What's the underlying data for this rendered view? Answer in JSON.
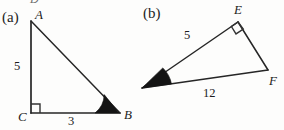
{
  "figure": {
    "background_color": "#fdfdfc",
    "ink_color": "#1c1c1c",
    "clipped_glyph_top": "D",
    "panels": [
      {
        "tag": "(a)",
        "tag_pos": {
          "x": 2,
          "y": 10
        },
        "triangle": {
          "name": "triangle-abc",
          "vertices": [
            {
              "label": "A",
              "x": 31,
              "y": 21,
              "label_x": 35,
              "label_y": 8
            },
            {
              "label": "B",
              "x": 119,
              "y": 113,
              "label_x": 124,
              "label_y": 108
            },
            {
              "label": "C",
              "x": 31,
              "y": 113,
              "label_x": 18,
              "label_y": 110
            }
          ],
          "right_angle_at": "C",
          "marked_angle_at": "B",
          "sides": [
            {
              "label": "5",
              "from": "A",
              "to": "C",
              "label_x": 14,
              "label_y": 60
            },
            {
              "label": "3",
              "from": "C",
              "to": "B",
              "label_x": 68,
              "label_y": 115
            }
          ]
        }
      },
      {
        "tag": "(b)",
        "tag_pos": {
          "x": 143,
          "y": 6
        },
        "triangle": {
          "name": "triangle-def",
          "vertices": [
            {
              "label": "E",
              "x": 238,
              "y": 22,
              "label_x": 234,
              "label_y": 3
            },
            {
              "label": "F",
              "x": 268,
              "y": 70,
              "label_x": 269,
              "label_y": 74
            },
            {
              "label": "D",
              "x": 142,
              "y": 88,
              "label_x": 131,
              "label_y": 88
            }
          ],
          "right_angle_at": "E",
          "marked_angle_at": "D",
          "sides": [
            {
              "label": "5",
              "from": "D",
              "to": "E",
              "label_x": 184,
              "label_y": 29
            },
            {
              "label": "12",
              "from": "D",
              "to": "F",
              "label_x": 203,
              "label_y": 87
            }
          ]
        }
      }
    ]
  }
}
